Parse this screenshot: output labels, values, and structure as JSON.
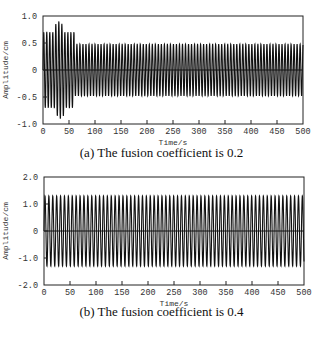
{
  "chart_data": [
    {
      "type": "line",
      "title": "",
      "caption": "(a) The fusion coefficient is 0.2",
      "xlabel": "Time/s",
      "ylabel": "Amplitude/cm",
      "xlim": [
        0,
        500
      ],
      "ylim": [
        -1.0,
        1.0
      ],
      "xticks": [
        0,
        50,
        100,
        150,
        200,
        250,
        300,
        350,
        400,
        450,
        500
      ],
      "yticks": [
        -1.0,
        -0.5,
        0,
        0.5,
        1.0
      ],
      "ytick_labels": [
        "-1.0",
        "-0.5",
        "0",
        "0.5",
        "1.0"
      ],
      "grid": false,
      "signal": {
        "description": "Oscillating displacement with initial transient then steady amplitude",
        "period_s": 5.8,
        "transient_envelope": [
          {
            "t": 2,
            "amp": 0.7
          },
          {
            "t": 8,
            "amp": 0.7
          },
          {
            "t": 14,
            "amp": 0.7
          },
          {
            "t": 20,
            "amp": 0.7
          },
          {
            "t": 26,
            "amp": 0.85
          },
          {
            "t": 32,
            "amp": 0.9
          },
          {
            "t": 38,
            "amp": 0.85
          },
          {
            "t": 44,
            "amp": 0.7
          },
          {
            "t": 50,
            "amp": 0.7
          },
          {
            "t": 56,
            "amp": 0.7
          }
        ],
        "steady_amplitude": 0.48,
        "steady_from_s": 60
      }
    },
    {
      "type": "line",
      "title": "",
      "caption": "(b) The fusion coefficient is 0.4",
      "xlabel": "Time/s",
      "ylabel": "Amplitude/cm",
      "xlim": [
        0,
        500
      ],
      "ylim": [
        -2.0,
        2.0
      ],
      "xticks": [
        0,
        50,
        100,
        150,
        200,
        250,
        300,
        350,
        400,
        450,
        500
      ],
      "yticks": [
        -2.0,
        -1.0,
        0,
        1.0,
        2.0
      ],
      "ytick_labels": [
        "-2.0",
        "-1.0",
        "0",
        "1.0",
        "2.0"
      ],
      "grid": false,
      "signal": {
        "description": "Steady oscillation with constant amplitude",
        "period_s": 7.5,
        "transient_envelope": [],
        "steady_amplitude": 1.3,
        "steady_from_s": 0
      }
    }
  ],
  "panels": {
    "a": {
      "caption": "(a) The fusion coefficient is 0.2",
      "xlabel": "Time/s",
      "ylabel": "Amplitude/cm"
    },
    "b": {
      "caption": "(b) The fusion coefficient is 0.4",
      "xlabel": "Time/s",
      "ylabel": "Amplitude/cm"
    }
  },
  "colors": {
    "line": "#111111",
    "frame": "#222222",
    "background": "#ffffff"
  }
}
